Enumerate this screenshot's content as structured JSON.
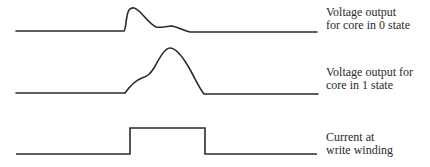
{
  "diagram": {
    "waveforms": [
      {
        "id": "core-0-voltage",
        "label_lines": [
          "Voltage output",
          "for core in 0 state"
        ],
        "shape": "small sharp spike followed by decaying ripple"
      },
      {
        "id": "core-1-voltage",
        "label_lines": [
          "Voltage output for",
          "core in 1 state"
        ],
        "shape": "large broad pulse with shoulder on rising edge"
      },
      {
        "id": "write-current",
        "label_lines": [
          "Current at",
          "write winding"
        ],
        "shape": "rectangular pulse"
      }
    ],
    "stroke_color": "#2a2a2a"
  }
}
